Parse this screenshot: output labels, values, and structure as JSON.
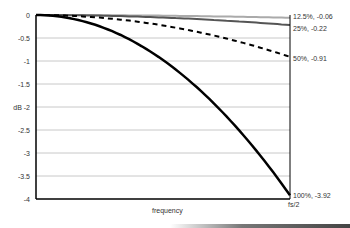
{
  "chart_data": {
    "type": "line",
    "title": "",
    "xlabel": "frequency",
    "ylabel": "dB",
    "x_tick_labels": [
      "fs/2"
    ],
    "y_ticks": [
      0,
      -0.5,
      -1,
      -1.5,
      -2,
      -2.5,
      -3,
      -3.5,
      -4
    ],
    "y_tick_labels": [
      "0",
      "-0.5",
      "-1",
      "-1.5",
      "dB -2",
      "-2.5",
      "-3",
      "-3.5",
      "-4"
    ],
    "ylim": [
      -4,
      0
    ],
    "xlim": [
      0,
      1
    ],
    "grid": "horizontal",
    "series": [
      {
        "name": "12.5%",
        "end_value": -0.06,
        "label": "12.5%, -0.06",
        "style": "solid",
        "color": "#aaaaaa",
        "width": 2
      },
      {
        "name": "25%",
        "end_value": -0.22,
        "label": "25%, -0.22",
        "style": "solid",
        "color": "#555555",
        "width": 2
      },
      {
        "name": "50%",
        "end_value": -0.91,
        "label": "50%, -0.91",
        "style": "dashed",
        "color": "#000000",
        "width": 2
      },
      {
        "name": "100%",
        "end_value": -3.92,
        "label": "100%, -3.92",
        "style": "solid",
        "color": "#000000",
        "width": 2.5
      }
    ]
  }
}
